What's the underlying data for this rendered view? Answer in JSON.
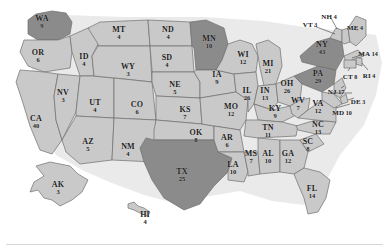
{
  "map": {
    "title": "United States Electoral College Map",
    "colors": {
      "light_state": "#c9c9c9",
      "dark_state": "#8b8b8b",
      "border": "#6e6e6e",
      "background": "#ffffff",
      "label_text": "#1b1b1b"
    },
    "highlighted_states": [
      "WA",
      "MN",
      "NY",
      "PA",
      "TX"
    ],
    "states": [
      {
        "abbr": "WA",
        "votes": "9",
        "x": 42,
        "y": 22,
        "shade": "dark"
      },
      {
        "abbr": "OR",
        "votes": "6",
        "x": 38,
        "y": 56,
        "shade": "light"
      },
      {
        "abbr": "CA",
        "votes": "40",
        "x": 36,
        "y": 122,
        "shade": "light"
      },
      {
        "abbr": "NV",
        "votes": "3",
        "x": 63,
        "y": 96,
        "shade": "light"
      },
      {
        "abbr": "ID",
        "votes": "4",
        "x": 84,
        "y": 60,
        "shade": "light"
      },
      {
        "abbr": "UT",
        "votes": "4",
        "x": 95,
        "y": 106,
        "shade": "light"
      },
      {
        "abbr": "AZ",
        "votes": "5",
        "x": 88,
        "y": 145,
        "shade": "light"
      },
      {
        "abbr": "MT",
        "votes": "4",
        "x": 119,
        "y": 33,
        "shade": "light"
      },
      {
        "abbr": "WY",
        "votes": "3",
        "x": 128,
        "y": 70,
        "shade": "light"
      },
      {
        "abbr": "CO",
        "votes": "6",
        "x": 137,
        "y": 108,
        "shade": "light"
      },
      {
        "abbr": "NM",
        "votes": "4",
        "x": 128,
        "y": 150,
        "shade": "light"
      },
      {
        "abbr": "ND",
        "votes": "4",
        "x": 168,
        "y": 33,
        "shade": "light"
      },
      {
        "abbr": "SD",
        "votes": "4",
        "x": 167,
        "y": 61,
        "shade": "light"
      },
      {
        "abbr": "NE",
        "votes": "5",
        "x": 175,
        "y": 88,
        "shade": "light"
      },
      {
        "abbr": "KS",
        "votes": "7",
        "x": 185,
        "y": 113,
        "shade": "light"
      },
      {
        "abbr": "OK",
        "votes": "8",
        "x": 196,
        "y": 136,
        "shade": "light"
      },
      {
        "abbr": "TX",
        "votes": "25",
        "x": 182,
        "y": 175,
        "shade": "dark"
      },
      {
        "abbr": "MN",
        "votes": "10",
        "x": 209,
        "y": 42,
        "shade": "dark"
      },
      {
        "abbr": "IA",
        "votes": "9",
        "x": 217,
        "y": 78,
        "shade": "light"
      },
      {
        "abbr": "MO",
        "votes": "12",
        "x": 231,
        "y": 110,
        "shade": "light"
      },
      {
        "abbr": "AR",
        "votes": "6",
        "x": 227,
        "y": 141,
        "shade": "light"
      },
      {
        "abbr": "LA",
        "votes": "10",
        "x": 233,
        "y": 168,
        "shade": "light"
      },
      {
        "abbr": "WI",
        "votes": "12",
        "x": 243,
        "y": 58,
        "shade": "light"
      },
      {
        "abbr": "IL",
        "votes": "26",
        "x": 247,
        "y": 94,
        "shade": "light"
      },
      {
        "abbr": "MS",
        "votes": "7",
        "x": 251,
        "y": 157,
        "shade": "light"
      },
      {
        "abbr": "MI",
        "votes": "21",
        "x": 268,
        "y": 67,
        "shade": "light"
      },
      {
        "abbr": "IN",
        "votes": "13",
        "x": 265,
        "y": 94,
        "shade": "light"
      },
      {
        "abbr": "KY",
        "votes": "9",
        "x": 275,
        "y": 112,
        "shade": "light"
      },
      {
        "abbr": "TN",
        "votes": "11",
        "x": 268,
        "y": 131,
        "shade": "light"
      },
      {
        "abbr": "AL",
        "votes": "10",
        "x": 268,
        "y": 157,
        "shade": "light"
      },
      {
        "abbr": "OH",
        "votes": "26",
        "x": 287,
        "y": 87,
        "shade": "light"
      },
      {
        "abbr": "WV",
        "votes": "7",
        "x": 298,
        "y": 104,
        "shade": "light"
      },
      {
        "abbr": "GA",
        "votes": "12",
        "x": 288,
        "y": 157,
        "shade": "light"
      },
      {
        "abbr": "FL",
        "votes": "14",
        "x": 312,
        "y": 192,
        "shade": "light"
      },
      {
        "abbr": "VA",
        "votes": "12",
        "x": 318,
        "y": 107,
        "shade": "light"
      },
      {
        "abbr": "NC",
        "votes": "13",
        "x": 318,
        "y": 128,
        "shade": "light"
      },
      {
        "abbr": "SC",
        "votes": "8",
        "x": 308,
        "y": 145,
        "shade": "light"
      },
      {
        "abbr": "PA",
        "votes": "29",
        "x": 318,
        "y": 77,
        "shade": "dark"
      },
      {
        "abbr": "NY",
        "votes": "43",
        "x": 322,
        "y": 48,
        "shade": "dark"
      },
      {
        "abbr": "VT",
        "votes": "3",
        "x": 310,
        "y": 22,
        "shade": "light"
      },
      {
        "abbr": "NH",
        "votes": "4",
        "x": 329,
        "y": 14,
        "shade": "light"
      },
      {
        "abbr": "ME",
        "votes": "4",
        "x": 355,
        "y": 25,
        "shade": "light"
      },
      {
        "abbr": "MA",
        "votes": "14",
        "x": 368,
        "y": 51,
        "shade": "light"
      },
      {
        "abbr": "RI",
        "votes": "4",
        "x": 369,
        "y": 73,
        "shade": "light"
      },
      {
        "abbr": "CT",
        "votes": "8",
        "x": 350,
        "y": 74,
        "shade": "light"
      },
      {
        "abbr": "NJ",
        "votes": "17",
        "x": 336,
        "y": 89,
        "shade": "light"
      },
      {
        "abbr": "DE",
        "votes": "3",
        "x": 358,
        "y": 99,
        "shade": "light"
      },
      {
        "abbr": "MD",
        "votes": "10",
        "x": 342,
        "y": 110,
        "shade": "light"
      },
      {
        "abbr": "AK",
        "votes": "3",
        "x": 58,
        "y": 188,
        "shade": "light"
      },
      {
        "abbr": "HI",
        "votes": "4",
        "x": 145,
        "y": 218,
        "shade": "light"
      }
    ]
  }
}
